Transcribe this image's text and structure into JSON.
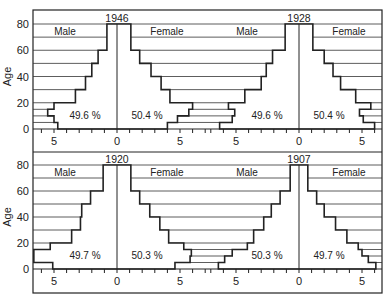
{
  "chart_data": {
    "type": "bar",
    "subtype": "population-pyramid",
    "ylabel": "Age",
    "yticks": [
      0,
      20,
      40,
      60,
      80
    ],
    "xticks_labels": [
      "5",
      "0",
      "5"
    ],
    "age_groups": [
      "0-5",
      "5-10",
      "10-15",
      "15-20",
      "20-30",
      "30-40",
      "40-50",
      "50-60",
      "60-70",
      "70-80"
    ],
    "panels": [
      {
        "year": "1946",
        "male_pct": "49.6 %",
        "female_pct": "50.4 %",
        "male": [
          4.7,
          5.0,
          5.5,
          5.0,
          3.3,
          2.5,
          2.0,
          1.5,
          0.8,
          0.8
        ],
        "female": [
          4.0,
          4.8,
          5.7,
          6.0,
          4.2,
          3.5,
          2.7,
          1.8,
          1.1,
          1.1
        ]
      },
      {
        "year": "1928",
        "male_pct": "49.6 %",
        "female_pct": "50.4 %",
        "male": [
          6.3,
          5.3,
          5.1,
          5.6,
          4.3,
          3.0,
          2.6,
          2.1,
          1.1,
          1.1
        ],
        "female": [
          6.0,
          5.1,
          4.8,
          5.7,
          4.5,
          3.3,
          2.7,
          2.0,
          1.1,
          1.1
        ]
      },
      {
        "year": "1920",
        "male_pct": "49.7 %",
        "female_pct": "50.3 %",
        "male": [
          5.1,
          6.6,
          6.6,
          5.3,
          3.6,
          2.9,
          2.8,
          2.1,
          1.1,
          1.1
        ],
        "female": [
          4.6,
          5.8,
          5.9,
          5.3,
          4.1,
          3.4,
          2.6,
          1.8,
          1.1,
          1.1
        ]
      },
      {
        "year": "1907",
        "male_pct": "50.3 %",
        "female_pct": "49.7 %",
        "male": [
          6.4,
          5.9,
          5.3,
          4.1,
          3.6,
          2.8,
          2.2,
          1.5,
          0.7,
          0.7
        ],
        "female": [
          6.1,
          5.5,
          5.0,
          4.7,
          3.8,
          2.9,
          2.0,
          1.4,
          0.7,
          0.7
        ]
      }
    ]
  },
  "labels": {
    "male": "Male",
    "female": "Female",
    "age": "Age"
  }
}
